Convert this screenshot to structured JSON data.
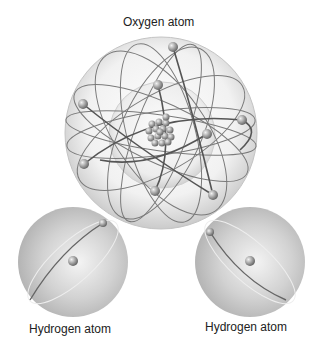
{
  "diagram": {
    "labels": {
      "oxygen": "Oxygen atom",
      "hydrogen_left": "Hydrogen atom",
      "hydrogen_right": "Hydrogen atom"
    },
    "oxygen": {
      "nucleus_particles": 16,
      "electrons": 8,
      "shells": 2
    },
    "hydrogen": {
      "electrons": 1,
      "nucleus_particles": 1
    },
    "colors": {
      "sphere": "#d9d9d9",
      "orbit": "#6e6e6e",
      "electron": "#9a9a9a",
      "text": "#222222"
    }
  }
}
